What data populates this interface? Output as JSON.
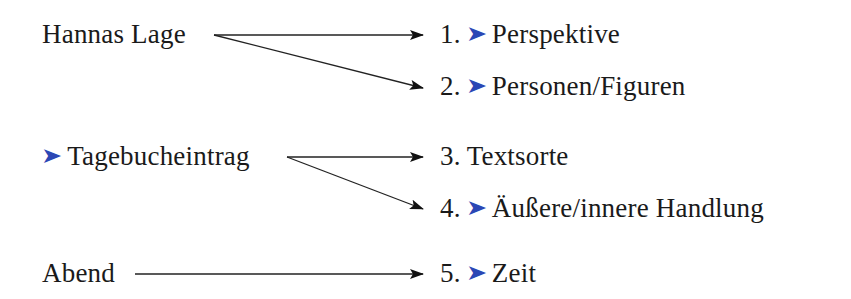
{
  "diagram": {
    "accent_color": "#2b47b5",
    "line_color": "#1a1a1a",
    "bullet_glyph": "➤",
    "sources": [
      {
        "id": "hannas-lage",
        "label": "Hannas Lage",
        "bullet": false
      },
      {
        "id": "tagebucheintrag",
        "label": "Tagebucheintrag",
        "bullet": true
      },
      {
        "id": "abend",
        "label": "Abend",
        "bullet": false
      }
    ],
    "targets": [
      {
        "num": "1.",
        "label": "Perspektive",
        "bullet": true
      },
      {
        "num": "2.",
        "label": "Personen/Figuren",
        "bullet": true
      },
      {
        "num": "3.",
        "label": "Textsorte",
        "bullet": false
      },
      {
        "num": "4.",
        "label": "Äußere/innere Handlung",
        "bullet": true
      },
      {
        "num": "5.",
        "label": "Zeit",
        "bullet": true
      }
    ],
    "edges": [
      {
        "from": "Hannas Lage",
        "to": "1. Perspektive"
      },
      {
        "from": "Hannas Lage",
        "to": "2. Personen/Figuren"
      },
      {
        "from": "Tagebucheintrag",
        "to": "3. Textsorte"
      },
      {
        "from": "Tagebucheintrag",
        "to": "4. Äußere/innere Handlung"
      },
      {
        "from": "Abend",
        "to": "5. Zeit"
      }
    ]
  }
}
